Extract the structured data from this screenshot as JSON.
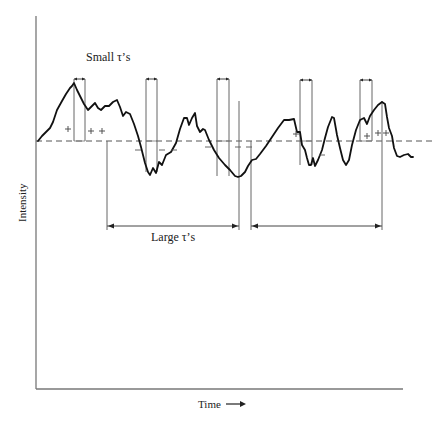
{
  "diagram": {
    "type": "signal-autocorrelation-illustration",
    "labels": {
      "small_tau": "Small τ’s",
      "large_tau": "Large τ’s",
      "y_axis": "Intensity",
      "x_axis": "Time",
      "x_axis_arrow": "→"
    },
    "axes": {
      "origin": [
        36,
        389
      ],
      "y_top": 16,
      "x_right": 403,
      "color": "#777777"
    },
    "baseline": {
      "y": 141,
      "x_start": 36,
      "x_end": 434,
      "style": "dashed"
    },
    "curve": {
      "color": "#111111",
      "points": [
        [
          38,
          141
        ],
        [
          42,
          136
        ],
        [
          46,
          132
        ],
        [
          50,
          128
        ],
        [
          53,
          122
        ],
        [
          57,
          110
        ],
        [
          62,
          101
        ],
        [
          66,
          94
        ],
        [
          70,
          88
        ],
        [
          72,
          86
        ],
        [
          74,
          83
        ],
        [
          77,
          90
        ],
        [
          80,
          96
        ],
        [
          84,
          104
        ],
        [
          88,
          110
        ],
        [
          92,
          106
        ],
        [
          95,
          103
        ],
        [
          98,
          108
        ],
        [
          101,
          110
        ],
        [
          105,
          106
        ],
        [
          109,
          106
        ],
        [
          113,
          102
        ],
        [
          117,
          100
        ],
        [
          120,
          107
        ],
        [
          123,
          116
        ],
        [
          126,
          112
        ],
        [
          130,
          114
        ],
        [
          134,
          124
        ],
        [
          138,
          136
        ],
        [
          141,
          147
        ],
        [
          145,
          163
        ],
        [
          148,
          172
        ],
        [
          150,
          175
        ],
        [
          153,
          168
        ],
        [
          156,
          173
        ],
        [
          159,
          162
        ],
        [
          162,
          165
        ],
        [
          166,
          155
        ],
        [
          171,
          152
        ],
        [
          176,
          143
        ],
        [
          180,
          129
        ],
        [
          184,
          118
        ],
        [
          187,
          118
        ],
        [
          189,
          125
        ],
        [
          192,
          118
        ],
        [
          195,
          113
        ],
        [
          197,
          126
        ],
        [
          200,
          132
        ],
        [
          203,
          129
        ],
        [
          205,
          130
        ],
        [
          209,
          140
        ],
        [
          214,
          150
        ],
        [
          219,
          158
        ],
        [
          225,
          165
        ],
        [
          230,
          170
        ],
        [
          235,
          176
        ],
        [
          238,
          177
        ],
        [
          241,
          176
        ],
        [
          245,
          172
        ],
        [
          248,
          166
        ],
        [
          252,
          160
        ],
        [
          256,
          159
        ],
        [
          260,
          154
        ],
        [
          266,
          146
        ],
        [
          272,
          137
        ],
        [
          278,
          128
        ],
        [
          284,
          120
        ],
        [
          289,
          120
        ],
        [
          294,
          119
        ],
        [
          297,
          132
        ],
        [
          300,
          132
        ],
        [
          302,
          145
        ],
        [
          305,
          150
        ],
        [
          307,
          158
        ],
        [
          309,
          165
        ],
        [
          311,
          165
        ],
        [
          313,
          158
        ],
        [
          315,
          166
        ],
        [
          318,
          160
        ],
        [
          322,
          150
        ],
        [
          325,
          138
        ],
        [
          328,
          127
        ],
        [
          332,
          117
        ],
        [
          334,
          118
        ],
        [
          337,
          135
        ],
        [
          340,
          148
        ],
        [
          343,
          160
        ],
        [
          346,
          165
        ],
        [
          349,
          160
        ],
        [
          352,
          145
        ],
        [
          356,
          130
        ],
        [
          360,
          120
        ],
        [
          364,
          118
        ],
        [
          367,
          124
        ],
        [
          370,
          116
        ],
        [
          374,
          110
        ],
        [
          378,
          105
        ],
        [
          382,
          102
        ],
        [
          385,
          104
        ],
        [
          387,
          117
        ],
        [
          389,
          128
        ],
        [
          392,
          136
        ],
        [
          394,
          148
        ],
        [
          397,
          156
        ],
        [
          400,
          157
        ],
        [
          404,
          155
        ],
        [
          408,
          154
        ],
        [
          411,
          157
        ],
        [
          413,
          157
        ]
      ]
    },
    "small_tau_bars": [
      {
        "x1": 74,
        "x2": 85,
        "top": 79,
        "bottom": 141
      },
      {
        "x1": 146,
        "x2": 157,
        "top": 79,
        "bottom": 172
      },
      {
        "x1": 217,
        "x2": 229,
        "top": 79,
        "bottom": 176
      },
      {
        "x1": 300,
        "x2": 312,
        "top": 80,
        "bottom": 165
      },
      {
        "x1": 360,
        "x2": 372,
        "top": 80,
        "bottom": 141
      }
    ],
    "large_tau_spans": [
      {
        "x1": 107,
        "x2": 239,
        "line_top": 141,
        "arrow_y": 226
      },
      {
        "x1": 251,
        "x2": 382,
        "line_top": 141,
        "arrow_y": 226
      }
    ],
    "plus_marks": [
      [
        68,
        129
      ],
      [
        91,
        131
      ],
      [
        102,
        131
      ],
      [
        296,
        134
      ],
      [
        367,
        136
      ],
      [
        378,
        133
      ],
      [
        386,
        133
      ]
    ],
    "minus_marks": [
      [
        138,
        150
      ],
      [
        162,
        150
      ],
      [
        174,
        150
      ],
      [
        208,
        147
      ],
      [
        238,
        147
      ],
      [
        249,
        147
      ],
      [
        322,
        155
      ]
    ]
  }
}
